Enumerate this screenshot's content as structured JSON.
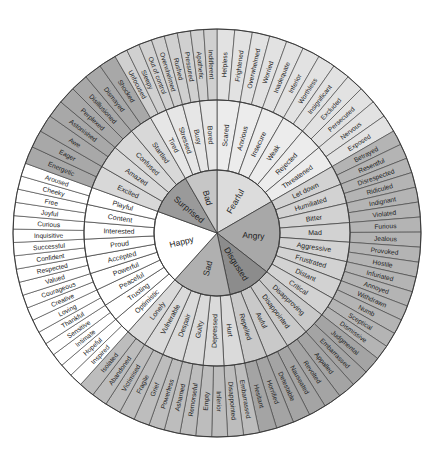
{
  "title": "Feelings Wheel",
  "geometry": {
    "cx": 217,
    "cy": 233,
    "r_inner": 63,
    "r_mid": 133,
    "r_outer": 204
  },
  "colors": {
    "Fearful": {
      "inner": "#dcdcdc",
      "mid": "#ececec",
      "outer": "#e2e2e2"
    },
    "Angry": {
      "inner": "#a8a8a8",
      "mid": "#d2d2d2",
      "outer": "#b4b4b4"
    },
    "Disgusted": {
      "inner": "#8c8c8c",
      "mid": "#c9c9c9",
      "outer": "#a4a4a4"
    },
    "Sad": {
      "inner": "#b0b0b0",
      "mid": "#dadada",
      "outer": "#bdbdbd"
    },
    "Happy": {
      "inner": "#ffffff",
      "mid": "#ffffff",
      "outer": "#ffffff"
    },
    "Surprised": {
      "inner": "#9a9a9a",
      "mid": "#d8d8d8",
      "outer": "#a8a8a8"
    },
    "Bad": {
      "inner": "#c6c6c6",
      "mid": "#e6e6e6",
      "outer": "#d0d0d0"
    },
    "stroke": "#3a3a3a"
  },
  "emotions": [
    {
      "core": "Fearful",
      "start": 0,
      "end": 60,
      "secondary": [
        {
          "label": "Scared",
          "tertiary": [
            "Helpless",
            "Frightened"
          ]
        },
        {
          "label": "Anxious",
          "tertiary": [
            "Overwhelmed",
            "Worried"
          ]
        },
        {
          "label": "Insecure",
          "tertiary": [
            "Inadequate",
            "Inferior"
          ]
        },
        {
          "label": "Weak",
          "tertiary": [
            "Worthless",
            "Insignificant"
          ]
        },
        {
          "label": "Rejected",
          "tertiary": [
            "Excluded",
            "Persecuted"
          ]
        },
        {
          "label": "Threatened",
          "tertiary": [
            "Nervous",
            "Exposed"
          ]
        }
      ]
    },
    {
      "core": "Angry",
      "start": 60,
      "end": 128,
      "secondary": [
        {
          "label": "Let down",
          "tertiary": [
            "Betrayed",
            "Resentful"
          ]
        },
        {
          "label": "Humiliated",
          "tertiary": [
            "Disrespected",
            "Ridiculed"
          ]
        },
        {
          "label": "Bitter",
          "tertiary": [
            "Indignant",
            "Violated"
          ]
        },
        {
          "label": "Mad",
          "tertiary": [
            "Furious",
            "Jealous"
          ]
        },
        {
          "label": "Aggressive",
          "tertiary": [
            "Provoked",
            "Hostile"
          ]
        },
        {
          "label": "Frustrated",
          "tertiary": [
            "Infuriated",
            "Annoyed"
          ]
        },
        {
          "label": "Distant",
          "tertiary": [
            "Withdrawn",
            "Numb"
          ]
        },
        {
          "label": "Critical",
          "tertiary": [
            "Sceptical",
            "Dismissive"
          ]
        }
      ]
    },
    {
      "core": "Disgusted",
      "start": 128,
      "end": 168,
      "secondary": [
        {
          "label": "Disapproving",
          "tertiary": [
            "Judgmental",
            "Embarrassed"
          ]
        },
        {
          "label": "Disappointed",
          "tertiary": [
            "Appalled",
            "Revolted"
          ]
        },
        {
          "label": "Awful",
          "tertiary": [
            "Nauseated",
            "Detestable"
          ]
        },
        {
          "label": "Repelled",
          "tertiary": [
            "Horrified",
            "Hesitant"
          ]
        }
      ]
    },
    {
      "core": "Sad",
      "start": 168,
      "end": 222,
      "secondary": [
        {
          "label": "Hurt",
          "tertiary": [
            "Embarrassed",
            "Disappointed"
          ]
        },
        {
          "label": "Depressed",
          "tertiary": [
            "Inferior",
            "Empty"
          ]
        },
        {
          "label": "Guilty",
          "tertiary": [
            "Remorseful",
            "Ashamed"
          ]
        },
        {
          "label": "Despair",
          "tertiary": [
            "Powerless",
            "Grief"
          ]
        },
        {
          "label": "Vulnerable",
          "tertiary": [
            "Fragile",
            "Victimised"
          ]
        },
        {
          "label": "Lonely",
          "tertiary": [
            "Abandoned",
            "Isolated"
          ]
        }
      ]
    },
    {
      "core": "Happy",
      "start": 222,
      "end": 290,
      "secondary": [
        {
          "label": "Optimistic",
          "tertiary": [
            "Inspired",
            "Hopeful"
          ]
        },
        {
          "label": "Trusting",
          "tertiary": [
            "Intimate",
            "Sensitive"
          ]
        },
        {
          "label": "Peaceful",
          "tertiary": [
            "Thankful",
            "Loving"
          ]
        },
        {
          "label": "Powerful",
          "tertiary": [
            "Creative",
            "Courageous"
          ]
        },
        {
          "label": "Accepted",
          "tertiary": [
            "Valued",
            "Respected"
          ]
        },
        {
          "label": "Proud",
          "tertiary": [
            "Confident",
            "Successful"
          ]
        },
        {
          "label": "Interested",
          "tertiary": [
            "Inquisitive",
            "Curious"
          ]
        },
        {
          "label": "Content",
          "tertiary": [
            "Joyful",
            "Free"
          ]
        },
        {
          "label": "Playful",
          "tertiary": [
            "Cheeky",
            "Aroused"
          ]
        }
      ]
    },
    {
      "core": "Surprised",
      "start": 290,
      "end": 330,
      "secondary": [
        {
          "label": "Excited",
          "tertiary": [
            "Energetic",
            "Eager"
          ]
        },
        {
          "label": "Amazed",
          "tertiary": [
            "Awe",
            "Astonished"
          ]
        },
        {
          "label": "Confused",
          "tertiary": [
            "Perplexed",
            "Disillusioned"
          ]
        },
        {
          "label": "Startled",
          "tertiary": [
            "Dismayed",
            "Shocked"
          ]
        }
      ]
    },
    {
      "core": "Bad",
      "start": 330,
      "end": 360,
      "secondary": [
        {
          "label": "Tired",
          "tertiary": [
            "Unfocused",
            "Sleepy"
          ]
        },
        {
          "label": "Stressed",
          "tertiary": [
            "Out of control",
            "Overwhelmed"
          ]
        },
        {
          "label": "Busy",
          "tertiary": [
            "Rushed",
            "Pressured"
          ]
        },
        {
          "label": "Bored",
          "tertiary": [
            "Apathetic",
            "Indifferent"
          ]
        }
      ]
    }
  ]
}
